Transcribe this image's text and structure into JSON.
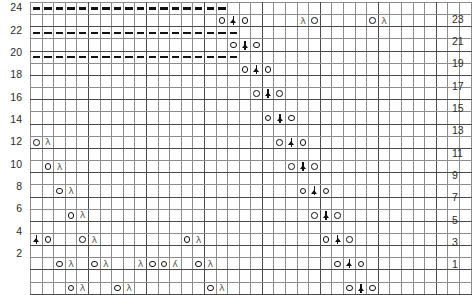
{
  "chart_data": {
    "type": "table",
    "grid": {
      "columns": 38,
      "rows": 24
    },
    "axis": {
      "row_numbers_left": [
        24,
        22,
        20,
        18,
        16,
        14,
        12,
        10,
        8,
        6,
        4,
        2
      ],
      "row_numbers_right": [
        23,
        21,
        19,
        17,
        15,
        13,
        11,
        9,
        7,
        5,
        3,
        1
      ],
      "left_label_note": "even rows",
      "right_label_note": "odd rows"
    },
    "legend": {
      "yo": "yarn-over",
      "dec_right": "right-leaning-decrease",
      "dec_left": "left-leaning-decrease",
      "cdd": "centered-double-decrease",
      "dash": "purl-dash"
    },
    "colors": {
      "grid_line": "#8c8c8c",
      "grid_line_heavy": "#4a4a4a",
      "symbol": "#111111",
      "decrease_symbol": "#5d5d5d",
      "label": "#2b2b2b",
      "background": "#ffffff"
    },
    "cells": [
      {
        "row": 24,
        "symbols": [
          {
            "col": 1,
            "s": "dash"
          },
          {
            "col": 2,
            "s": "dash"
          },
          {
            "col": 3,
            "s": "dash"
          },
          {
            "col": 4,
            "s": "dash"
          },
          {
            "col": 5,
            "s": "dash"
          },
          {
            "col": 6,
            "s": "dash"
          },
          {
            "col": 7,
            "s": "dash"
          },
          {
            "col": 8,
            "s": "dash"
          },
          {
            "col": 9,
            "s": "dash"
          },
          {
            "col": 10,
            "s": "dash"
          },
          {
            "col": 11,
            "s": "dash"
          },
          {
            "col": 12,
            "s": "dash"
          },
          {
            "col": 13,
            "s": "dash"
          },
          {
            "col": 14,
            "s": "dash"
          },
          {
            "col": 15,
            "s": "dash"
          },
          {
            "col": 16,
            "s": "dash"
          },
          {
            "col": 17,
            "s": "dash"
          }
        ]
      },
      {
        "row": 23,
        "symbols": [
          {
            "col": 17,
            "s": "yo"
          },
          {
            "col": 18,
            "s": "cdd"
          },
          {
            "col": 19,
            "s": "yo"
          },
          {
            "col": 24,
            "s": "dec_right"
          },
          {
            "col": 25,
            "s": "yo"
          },
          {
            "col": 30,
            "s": "yo"
          },
          {
            "col": 31,
            "s": "dec_right"
          }
        ]
      },
      {
        "row": 22,
        "symbols": [
          {
            "col": 1,
            "s": "dash"
          },
          {
            "col": 2,
            "s": "dash"
          },
          {
            "col": 3,
            "s": "dash"
          },
          {
            "col": 4,
            "s": "dash"
          },
          {
            "col": 5,
            "s": "dash"
          },
          {
            "col": 6,
            "s": "dash"
          },
          {
            "col": 7,
            "s": "dash"
          },
          {
            "col": 8,
            "s": "dash"
          },
          {
            "col": 9,
            "s": "dash"
          },
          {
            "col": 10,
            "s": "dash"
          },
          {
            "col": 11,
            "s": "dash"
          },
          {
            "col": 12,
            "s": "dash"
          },
          {
            "col": 13,
            "s": "dash"
          },
          {
            "col": 14,
            "s": "dash"
          },
          {
            "col": 15,
            "s": "dash"
          },
          {
            "col": 16,
            "s": "dash"
          },
          {
            "col": 17,
            "s": "dash"
          },
          {
            "col": 18,
            "s": "dash"
          }
        ]
      },
      {
        "row": 21,
        "symbols": [
          {
            "col": 18,
            "s": "yo"
          },
          {
            "col": 19,
            "s": "cdd"
          },
          {
            "col": 20,
            "s": "yo"
          }
        ]
      },
      {
        "row": 20,
        "symbols": [
          {
            "col": 1,
            "s": "dash"
          },
          {
            "col": 2,
            "s": "dash"
          },
          {
            "col": 3,
            "s": "dash"
          },
          {
            "col": 4,
            "s": "dash"
          },
          {
            "col": 5,
            "s": "dash"
          },
          {
            "col": 6,
            "s": "dash"
          },
          {
            "col": 7,
            "s": "dash"
          },
          {
            "col": 8,
            "s": "dash"
          },
          {
            "col": 9,
            "s": "dash"
          },
          {
            "col": 10,
            "s": "dash"
          },
          {
            "col": 11,
            "s": "dash"
          },
          {
            "col": 12,
            "s": "dash"
          },
          {
            "col": 13,
            "s": "dash"
          },
          {
            "col": 14,
            "s": "dash"
          },
          {
            "col": 15,
            "s": "dash"
          },
          {
            "col": 16,
            "s": "dash"
          },
          {
            "col": 17,
            "s": "dash"
          },
          {
            "col": 18,
            "s": "dash"
          }
        ]
      },
      {
        "row": 19,
        "symbols": [
          {
            "col": 19,
            "s": "yo"
          },
          {
            "col": 20,
            "s": "cdd"
          },
          {
            "col": 21,
            "s": "yo"
          }
        ]
      },
      {
        "row": 18,
        "symbols": []
      },
      {
        "row": 17,
        "symbols": [
          {
            "col": 20,
            "s": "yo"
          },
          {
            "col": 21,
            "s": "cdd"
          },
          {
            "col": 22,
            "s": "yo"
          }
        ]
      },
      {
        "row": 16,
        "symbols": []
      },
      {
        "row": 15,
        "symbols": [
          {
            "col": 21,
            "s": "yo"
          },
          {
            "col": 22,
            "s": "cdd"
          },
          {
            "col": 23,
            "s": "yo"
          }
        ]
      },
      {
        "row": 14,
        "symbols": []
      },
      {
        "row": 13,
        "symbols": [
          {
            "col": 1,
            "s": "yo"
          },
          {
            "col": 2,
            "s": "dec_right"
          },
          {
            "col": 22,
            "s": "yo"
          },
          {
            "col": 23,
            "s": "cdd"
          },
          {
            "col": 24,
            "s": "yo"
          }
        ]
      },
      {
        "row": 12,
        "symbols": []
      },
      {
        "row": 11,
        "symbols": [
          {
            "col": 2,
            "s": "yo"
          },
          {
            "col": 3,
            "s": "dec_right"
          },
          {
            "col": 23,
            "s": "yo"
          },
          {
            "col": 24,
            "s": "cdd"
          },
          {
            "col": 25,
            "s": "yo"
          }
        ]
      },
      {
        "row": 10,
        "symbols": []
      },
      {
        "row": 9,
        "symbols": [
          {
            "col": 3,
            "s": "yo"
          },
          {
            "col": 4,
            "s": "dec_right"
          },
          {
            "col": 24,
            "s": "yo"
          },
          {
            "col": 25,
            "s": "cdd"
          },
          {
            "col": 26,
            "s": "yo"
          }
        ]
      },
      {
        "row": 8,
        "symbols": []
      },
      {
        "row": 7,
        "symbols": [
          {
            "col": 4,
            "s": "yo"
          },
          {
            "col": 5,
            "s": "dec_right"
          },
          {
            "col": 25,
            "s": "yo"
          },
          {
            "col": 26,
            "s": "cdd"
          },
          {
            "col": 27,
            "s": "yo"
          }
        ]
      },
      {
        "row": 6,
        "symbols": []
      },
      {
        "row": 5,
        "symbols": [
          {
            "col": 1,
            "s": "cdd"
          },
          {
            "col": 2,
            "s": "yo"
          },
          {
            "col": 5,
            "s": "yo"
          },
          {
            "col": 6,
            "s": "dec_right"
          },
          {
            "col": 14,
            "s": "yo"
          },
          {
            "col": 15,
            "s": "dec_right"
          },
          {
            "col": 26,
            "s": "yo"
          },
          {
            "col": 27,
            "s": "cdd"
          },
          {
            "col": 28,
            "s": "yo"
          }
        ]
      },
      {
        "row": 4,
        "symbols": []
      },
      {
        "row": 3,
        "symbols": [
          {
            "col": 3,
            "s": "yo"
          },
          {
            "col": 4,
            "s": "dec_right"
          },
          {
            "col": 6,
            "s": "yo"
          },
          {
            "col": 7,
            "s": "dec_right"
          },
          {
            "col": 10,
            "s": "dec_right"
          },
          {
            "col": 11,
            "s": "yo"
          },
          {
            "col": 12,
            "s": "yo"
          },
          {
            "col": 13,
            "s": "dec_left"
          },
          {
            "col": 15,
            "s": "yo"
          },
          {
            "col": 16,
            "s": "dec_right"
          },
          {
            "col": 27,
            "s": "yo"
          },
          {
            "col": 28,
            "s": "cdd"
          },
          {
            "col": 29,
            "s": "yo"
          }
        ]
      },
      {
        "row": 2,
        "symbols": []
      },
      {
        "row": 1,
        "symbols": [
          {
            "col": 4,
            "s": "yo"
          },
          {
            "col": 5,
            "s": "dec_right"
          },
          {
            "col": 8,
            "s": "yo"
          },
          {
            "col": 9,
            "s": "dec_right"
          },
          {
            "col": 16,
            "s": "yo"
          },
          {
            "col": 17,
            "s": "dec_right"
          },
          {
            "col": 28,
            "s": "yo"
          },
          {
            "col": 29,
            "s": "cdd"
          },
          {
            "col": 30,
            "s": "yo"
          }
        ]
      }
    ]
  }
}
